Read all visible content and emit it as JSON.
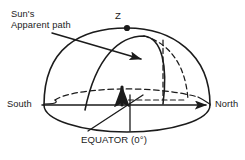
{
  "diagram": {
    "labels": {
      "sun_path_line1": "Sun's",
      "sun_path_line2": "Apparent path",
      "zenith": "Z",
      "south": "South",
      "north": "North",
      "equator": "EQUATOR (0°)"
    },
    "colors": {
      "stroke": "#1b1b1b",
      "background": "#ffffff",
      "text": "#1b1b1b"
    },
    "elements": {
      "dome_arc": "solid upper hemisphere outline",
      "horizon_line": "South to North horizontal axis with arrowhead at North",
      "celestial_equator": "dashed ellipse through sphere interior",
      "meridian_arc": "solid arc from horizon to zenith region",
      "hidden_meridian": "dashed arc and dashed vertical segment",
      "lower_sphere": "solid lower half ellipse",
      "observer_arrow": "bold vertical up arrow at sphere center",
      "sun_path_arrow": "straight arrow pointing right crossing the dome",
      "zenith_dot": "filled circle at top of dome"
    }
  }
}
